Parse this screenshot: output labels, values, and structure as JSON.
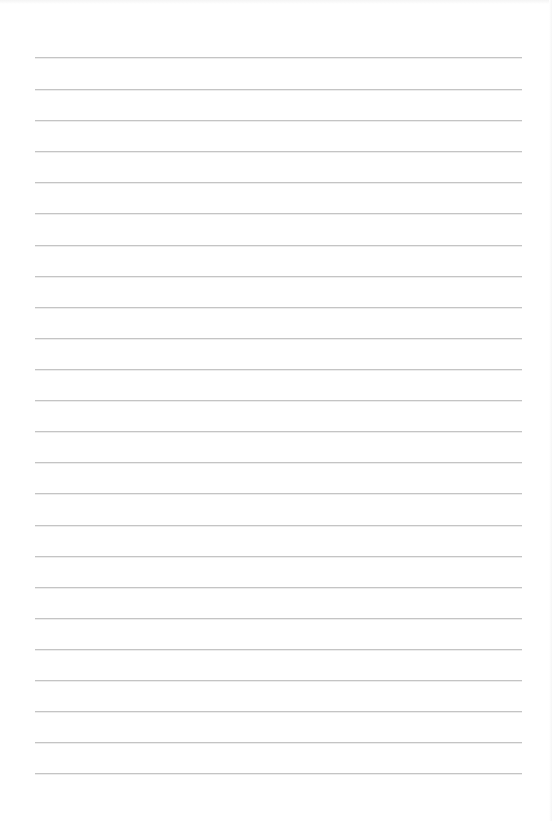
{
  "document": {
    "type": "lined-paper",
    "background_color": "#ffffff",
    "line_color": "#c4c4c4",
    "line_left_px": 35,
    "line_right_px": 522,
    "line_spacing_px": 31,
    "line_count": 24,
    "line_positions_px": [
      57,
      89,
      120,
      151,
      182,
      213,
      245,
      276,
      307,
      338,
      369,
      400,
      431,
      462,
      493,
      525,
      556,
      587,
      618,
      649,
      680,
      711,
      742,
      773
    ]
  }
}
